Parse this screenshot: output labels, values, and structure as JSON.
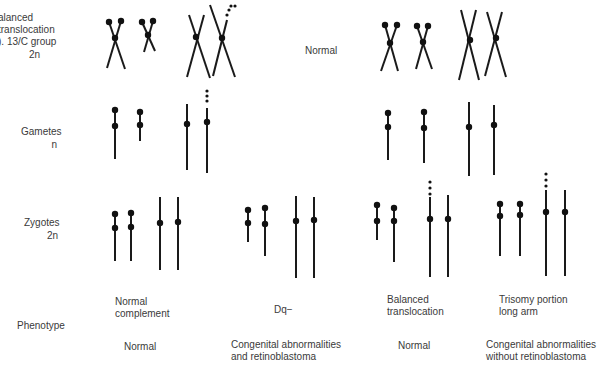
{
  "row_labels": {
    "parent_translocation": "alanced\ntranslocation\n). 13/C group",
    "parent_translocation_ploidy": "2n",
    "parent_normal": "Normal",
    "gametes": "Gametes",
    "gametes_ploidy": "n",
    "zygotes": "Zygotes",
    "zygotes_ploidy": "2n",
    "phenotype": "Phenotype"
  },
  "zygote_types": [
    {
      "label": "Normal\ncomplement",
      "phenotype": "Normal"
    },
    {
      "label": "Dq−",
      "phenotype": "Congenital abnormalities\nand retinoblastoma"
    },
    {
      "label": "Balanced\ntranslocation",
      "phenotype": "Normal"
    },
    {
      "label": "Trisomy portion\nlong arm",
      "phenotype": "Congenital abnormalities\nwithout retinoblastoma"
    }
  ],
  "colors": {
    "ink": "#1a1a1a",
    "text": "#3a3a3a",
    "background": "#ffffff"
  },
  "chromosomes": {
    "parents_crossed": [
      {
        "group": "translocation",
        "arms": [
          [
            109,
            22,
            125,
            69
          ],
          [
            121,
            21,
            107,
            68
          ]
        ],
        "cen": [
          115,
          38
        ],
        "heads": [
          [
            109,
            22
          ],
          [
            121,
            21
          ]
        ],
        "sats": []
      },
      {
        "group": "translocation",
        "arms": [
          [
            142,
            22,
            155,
            51
          ],
          [
            153,
            21,
            144,
            52
          ]
        ],
        "cen": [
          148,
          35
        ],
        "heads": [
          [
            142,
            22
          ],
          [
            153,
            21
          ]
        ],
        "sats": []
      },
      {
        "group": "translocation",
        "arms": [
          [
            189,
            15,
            210,
            78
          ],
          [
            204,
            15,
            187,
            77
          ]
        ],
        "cen": [
          196,
          37
        ],
        "heads": [],
        "sats": []
      },
      {
        "group": "translocation",
        "arms": [
          [
            210,
            5,
            235,
            77
          ],
          [
            227,
            20,
            213,
            76
          ]
        ],
        "cen": [
          222,
          38
        ],
        "heads": [],
        "sats": [
          [
            227,
            15
          ],
          [
            229,
            10
          ],
          [
            231,
            6
          ],
          [
            235,
            6
          ]
        ]
      },
      {
        "group": "normal",
        "arms": [
          [
            385,
            25,
            398,
            71
          ],
          [
            397,
            25,
            381,
            71
          ]
        ],
        "cen": [
          390,
          43
        ],
        "heads": [
          [
            385,
            25
          ],
          [
            397,
            25
          ]
        ],
        "sats": []
      },
      {
        "group": "normal",
        "arms": [
          [
            417,
            26,
            432,
            69
          ],
          [
            428,
            26,
            416,
            69
          ]
        ],
        "cen": [
          423,
          42
        ],
        "heads": [
          [
            417,
            26
          ],
          [
            428,
            26
          ]
        ],
        "sats": []
      },
      {
        "group": "normal",
        "arms": [
          [
            461,
            10,
            479,
            80
          ],
          [
            476,
            10,
            459,
            80
          ]
        ],
        "cen": [
          470,
          40
        ],
        "heads": [],
        "sats": []
      },
      {
        "group": "normal",
        "arms": [
          [
            487,
            12,
            506,
            77
          ],
          [
            502,
            12,
            485,
            76
          ]
        ],
        "cen": [
          496,
          38
        ],
        "heads": [],
        "sats": []
      }
    ],
    "gametes": [
      {
        "x": 115,
        "y1": 110,
        "y2": 159,
        "dots": [
          110,
          126
        ],
        "sats": []
      },
      {
        "x": 140,
        "y1": 112,
        "y2": 141,
        "dots": [
          112,
          125
        ],
        "sats": []
      },
      {
        "x": 187,
        "y1": 104,
        "y2": 170,
        "dots": [
          124
        ],
        "sats": []
      },
      {
        "x": 207,
        "y1": 108,
        "y2": 173,
        "dots": [
          122
        ],
        "sats": [
          91,
          96,
          101
        ]
      },
      {
        "x": 388,
        "y1": 113,
        "y2": 160,
        "dots": [
          113,
          127
        ],
        "sats": []
      },
      {
        "x": 424,
        "y1": 112,
        "y2": 163,
        "dots": [
          112,
          128
        ],
        "sats": []
      },
      {
        "x": 469,
        "y1": 102,
        "y2": 176,
        "dots": [
          127
        ],
        "sats": []
      },
      {
        "x": 494,
        "y1": 105,
        "y2": 175,
        "dots": [
          125
        ],
        "sats": []
      }
    ],
    "zygotes": [
      {
        "x": 115,
        "y1": 214,
        "y2": 261,
        "dots": [
          214,
          228
        ],
        "sats": []
      },
      {
        "x": 131,
        "y1": 213,
        "y2": 261,
        "dots": [
          213,
          227
        ],
        "sats": []
      },
      {
        "x": 160,
        "y1": 197,
        "y2": 270,
        "dots": [
          223
        ],
        "sats": []
      },
      {
        "x": 178,
        "y1": 197,
        "y2": 270,
        "dots": [
          222
        ],
        "sats": []
      },
      {
        "x": 248,
        "y1": 210,
        "y2": 242,
        "dots": [
          210,
          223
        ],
        "sats": []
      },
      {
        "x": 265,
        "y1": 208,
        "y2": 256,
        "dots": [
          208,
          224
        ],
        "sats": []
      },
      {
        "x": 296,
        "y1": 196,
        "y2": 278,
        "dots": [
          221
        ],
        "sats": []
      },
      {
        "x": 314,
        "y1": 197,
        "y2": 278,
        "dots": [
          220
        ],
        "sats": []
      },
      {
        "x": 377,
        "y1": 205,
        "y2": 240,
        "dots": [
          205,
          221
        ],
        "sats": []
      },
      {
        "x": 394,
        "y1": 208,
        "y2": 262,
        "dots": [
          208,
          221
        ],
        "sats": []
      },
      {
        "x": 430,
        "y1": 197,
        "y2": 277,
        "dots": [
          219
        ],
        "sats": [
          182,
          188,
          194
        ]
      },
      {
        "x": 448,
        "y1": 195,
        "y2": 277,
        "dots": [
          219
        ],
        "sats": []
      },
      {
        "x": 500,
        "y1": 204,
        "y2": 256,
        "dots": [
          204,
          216
        ],
        "sats": []
      },
      {
        "x": 520,
        "y1": 204,
        "y2": 256,
        "dots": [
          204,
          215
        ],
        "sats": []
      },
      {
        "x": 546,
        "y1": 190,
        "y2": 276,
        "dots": [
          212
        ],
        "sats": [
          174,
          180,
          186
        ]
      },
      {
        "x": 565,
        "y1": 190,
        "y2": 276,
        "dots": [
          212
        ],
        "sats": []
      }
    ]
  }
}
